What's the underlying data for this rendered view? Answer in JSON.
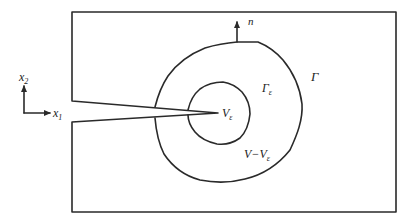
{
  "diagram": {
    "labels": {
      "axis_x1": {
        "base": "x",
        "sub": "1"
      },
      "axis_x2": {
        "base": "x",
        "sub": "2"
      },
      "normal": "n",
      "outer_contour": "Γ",
      "inner_contour": {
        "base": "Γ",
        "sub": "ε"
      },
      "inner_region": {
        "base": "V",
        "sub": "ε"
      },
      "annular_region": {
        "base": "V−V",
        "sub": "ε"
      }
    },
    "colors": {
      "line": "#2a2a2a",
      "background": "#ffffff"
    }
  }
}
